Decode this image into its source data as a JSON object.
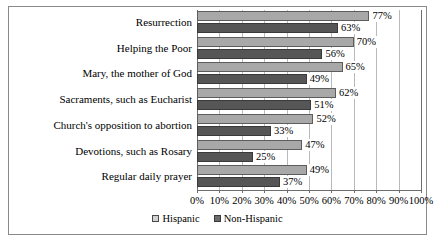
{
  "chart_data": {
    "type": "bar",
    "orientation": "horizontal",
    "title": "",
    "xlabel": "",
    "ylabel": "",
    "xlim": [
      0,
      100
    ],
    "xticks": [
      "0%",
      "10%",
      "20%",
      "30%",
      "40%",
      "50%",
      "60%",
      "70%",
      "80%",
      "90%",
      "100%"
    ],
    "xtick_values": [
      0,
      10,
      20,
      30,
      40,
      50,
      60,
      70,
      80,
      90,
      100
    ],
    "grid": true,
    "legend_position": "bottom",
    "categories": [
      "Resurrection",
      "Helping the Poor",
      "Mary, the mother of God",
      "Sacraments, such as Eucharist",
      "Church's opposition to abortion",
      "Devotions, such as Rosary",
      "Regular daily prayer"
    ],
    "series": [
      {
        "name": "Hispanic",
        "color": "#a8a8a8",
        "values": [
          77,
          70,
          65,
          62,
          52,
          47,
          49
        ],
        "labels": [
          "77%",
          "70%",
          "65%",
          "62%",
          "52%",
          "47%",
          "49%"
        ]
      },
      {
        "name": "Non-Hispanic",
        "color": "#565656",
        "values": [
          63,
          56,
          49,
          51,
          33,
          25,
          37
        ],
        "labels": [
          "63%",
          "56%",
          "49%",
          "51%",
          "33%",
          "25%",
          "37%"
        ]
      }
    ]
  },
  "legend": {
    "items": [
      {
        "label": "Hispanic",
        "swatch": "legend-swatch-hispanic"
      },
      {
        "label": "Non-Hispanic",
        "swatch": "legend-swatch-nonhispanic"
      }
    ]
  }
}
